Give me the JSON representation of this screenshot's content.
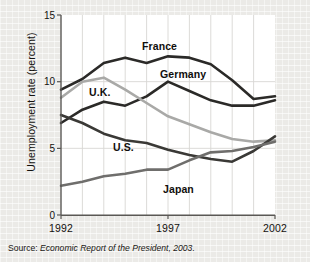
{
  "chart_data": {
    "type": "line",
    "title": "",
    "xlabel": "",
    "ylabel": "Unemployment rate (percent)",
    "xlim": [
      1992,
      2002
    ],
    "ylim": [
      0,
      15
    ],
    "yticks": [
      "0",
      "5",
      "10",
      "15"
    ],
    "ytick_values": [
      0,
      5,
      10,
      15
    ],
    "xticks": [
      "1992",
      "1997",
      "2002"
    ],
    "xtick_values": [
      1992,
      1997,
      2002
    ],
    "x": [
      1992,
      1993,
      1994,
      1995,
      1996,
      1997,
      1998,
      1999,
      2000,
      2001,
      2002
    ],
    "grid": "both",
    "legend": "inline-labels",
    "series": [
      {
        "name": "France",
        "color": "#2b2a28",
        "values": [
          9.4,
          10.2,
          11.4,
          11.8,
          11.4,
          11.9,
          11.8,
          11.3,
          10.1,
          8.7,
          8.9
        ]
      },
      {
        "name": "Germany",
        "color": "#2b2a28",
        "values": [
          6.9,
          7.9,
          8.5,
          8.2,
          8.9,
          10.0,
          9.3,
          8.6,
          8.2,
          8.2,
          8.6
        ]
      },
      {
        "name": "U.K.",
        "color": "#a9a9a7",
        "values": [
          8.8,
          10.0,
          10.3,
          9.4,
          8.4,
          7.4,
          6.8,
          6.2,
          5.7,
          5.5,
          5.6
        ]
      },
      {
        "name": "U.S.",
        "color": "#3a3936",
        "values": [
          7.5,
          6.9,
          6.1,
          5.6,
          5.4,
          4.9,
          4.5,
          4.2,
          4.0,
          4.8,
          5.9
        ]
      },
      {
        "name": "Japan",
        "color": "#6f6e6c",
        "values": [
          2.2,
          2.5,
          2.9,
          3.1,
          3.4,
          3.4,
          4.1,
          4.7,
          4.8,
          5.1,
          5.5
        ]
      }
    ],
    "series_labels": [
      {
        "name": "France",
        "text": "France",
        "x": 142,
        "y": 40
      },
      {
        "name": "Germany",
        "text": "Germany",
        "x": 160,
        "y": 68
      },
      {
        "name": "U.K.",
        "text": "U.K.",
        "x": 89,
        "y": 86
      },
      {
        "name": "U.S.",
        "text": "U.S.",
        "x": 113,
        "y": 141
      },
      {
        "name": "Japan",
        "text": "Japan",
        "x": 163,
        "y": 183
      }
    ]
  },
  "source": {
    "lead": "Source: ",
    "body": "Economic Report of the President, 2003."
  },
  "colors": {
    "paper": "#f1f0ed",
    "plot_background": "#ffffff",
    "axis": "#4a4845",
    "gridline": "#d8d7d4"
  }
}
